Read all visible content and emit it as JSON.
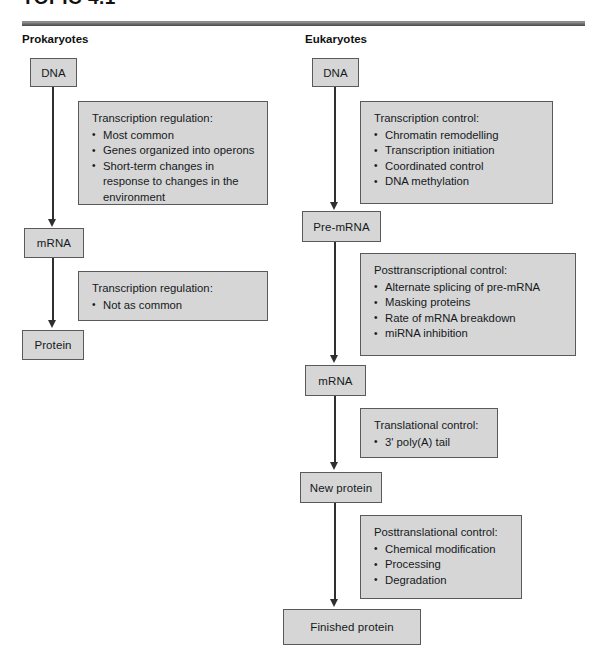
{
  "page": {
    "clipped_title": "TOPIC 4.1",
    "columns": [
      {
        "id": "prokaryotes",
        "heading": "Prokaryotes"
      },
      {
        "id": "eukaryotes",
        "heading": "Eukaryotes"
      }
    ]
  },
  "colors": {
    "box_fill": "#d6d6d6",
    "box_border": "#5a5a5a",
    "arrow": "#2f2f2f",
    "text": "#15191c",
    "rule": "#6e6e6e"
  },
  "prokaryotes": {
    "nodes": [
      {
        "id": "prok-dna",
        "label": "DNA"
      },
      {
        "id": "prok-mrna",
        "label": "mRNA"
      },
      {
        "id": "prok-protein",
        "label": "Protein"
      }
    ],
    "panels": [
      {
        "id": "prok-panel-transcription",
        "title": "Transcription regulation:",
        "items": [
          {
            "text": "Most common",
            "cont": ""
          },
          {
            "text": "Genes organized into operons",
            "cont": ""
          },
          {
            "text": "Short-term changes in",
            "cont": "response to changes in the environment"
          }
        ]
      },
      {
        "id": "prok-panel-translation",
        "title": "Transcription regulation:",
        "items": [
          {
            "text": "Not as common",
            "cont": ""
          }
        ]
      }
    ]
  },
  "eukaryotes": {
    "nodes": [
      {
        "id": "euk-dna",
        "label": "DNA"
      },
      {
        "id": "euk-pre-mrna",
        "label": "Pre-mRNA"
      },
      {
        "id": "euk-mrna",
        "label": "mRNA"
      },
      {
        "id": "euk-new-prot",
        "label": "New protein"
      },
      {
        "id": "euk-fin-prot",
        "label": "Finished protein"
      }
    ],
    "panels": [
      {
        "id": "euk-panel-transcription",
        "title": "Transcription control:",
        "items": [
          {
            "text": "Chromatin remodelling",
            "cont": ""
          },
          {
            "text": "Transcription initiation",
            "cont": ""
          },
          {
            "text": "Coordinated control",
            "cont": ""
          },
          {
            "text": "DNA methylation",
            "cont": ""
          }
        ]
      },
      {
        "id": "euk-panel-posttranscriptional",
        "title": "Posttranscriptional control:",
        "items": [
          {
            "text": "Alternate splicing of pre-mRNA",
            "cont": ""
          },
          {
            "text": "Masking proteins",
            "cont": ""
          },
          {
            "text": "Rate of mRNA breakdown",
            "cont": ""
          },
          {
            "text": "miRNA inhibition",
            "cont": ""
          }
        ]
      },
      {
        "id": "euk-panel-translational",
        "title": "Translational control:",
        "items": [
          {
            "text": "3' poly(A) tail",
            "cont": ""
          }
        ]
      },
      {
        "id": "euk-panel-posttranslational",
        "title": "Posttranslational control:",
        "items": [
          {
            "text": "Chemical modification",
            "cont": ""
          },
          {
            "text": "Processing",
            "cont": ""
          },
          {
            "text": "Degradation",
            "cont": ""
          }
        ]
      }
    ]
  }
}
